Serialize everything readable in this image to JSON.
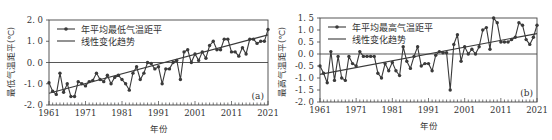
{
  "chart_data": [
    {
      "type": "line",
      "panel_label": "(a)",
      "title": "",
      "xlabel": "年份",
      "ylabel": "最低气温距平(℃)",
      "ylim": [
        -2.0,
        2.0
      ],
      "xlim": [
        1961,
        2021
      ],
      "yticks": [
        "2.0",
        "1.0",
        "0.0",
        "-1.0",
        "-2.0"
      ],
      "xticks": [
        "1961",
        "1971",
        "1981",
        "1991",
        "2001",
        "2011",
        "2021"
      ],
      "grid": false,
      "legend_position": "upper-left",
      "series": [
        {
          "name": "年平均最低气温距平",
          "marker": "circle",
          "x": [
            1961,
            1962,
            1963,
            1964,
            1965,
            1966,
            1967,
            1968,
            1969,
            1970,
            1971,
            1972,
            1973,
            1974,
            1975,
            1976,
            1977,
            1978,
            1979,
            1980,
            1981,
            1982,
            1983,
            1984,
            1985,
            1986,
            1987,
            1988,
            1989,
            1990,
            1991,
            1992,
            1993,
            1994,
            1995,
            1996,
            1997,
            1998,
            1999,
            2000,
            2001,
            2002,
            2003,
            2004,
            2005,
            2006,
            2007,
            2008,
            2009,
            2010,
            2011,
            2012,
            2013,
            2014,
            2015,
            2016,
            2017,
            2018,
            2019,
            2020,
            2021
          ],
          "values": [
            -0.95,
            -1.35,
            -1.5,
            -0.5,
            -1.4,
            -1.0,
            -1.6,
            -1.6,
            -0.9,
            -1.0,
            -1.1,
            -0.9,
            -0.85,
            -0.5,
            -0.8,
            -0.9,
            -0.6,
            -1.0,
            -0.7,
            -0.6,
            -0.8,
            -1.0,
            -1.3,
            -0.5,
            -0.2,
            -0.8,
            -0.5,
            0.0,
            -0.05,
            -0.3,
            -0.2,
            -1.0,
            -0.3,
            -0.3,
            0.0,
            0.1,
            -0.8,
            0.5,
            0.6,
            0.0,
            0.4,
            0.1,
            0.5,
            0.2,
            0.8,
            1.0,
            0.6,
            0.6,
            1.1,
            1.1,
            0.5,
            0.5,
            0.3,
            0.7,
            0.4,
            1.1,
            1.1,
            0.9,
            1.0,
            1.0,
            1.55
          ]
        },
        {
          "name": "线性变化趋势",
          "marker": "none",
          "x": [
            1961,
            2021
          ],
          "values": [
            -1.45,
            1.3
          ]
        }
      ]
    },
    {
      "type": "line",
      "panel_label": "(b)",
      "title": "",
      "xlabel": "年份",
      "ylabel": "最高气温距平(℃)",
      "ylim": [
        -2.0,
        1.5
      ],
      "xlim": [
        1961,
        2021
      ],
      "yticks": [
        "1.5",
        "1.0",
        "0.5",
        "0.0",
        "-0.5",
        "-1.0",
        "-1.5",
        "-2.0"
      ],
      "xticks": [
        "1961",
        "1971",
        "1981",
        "1991",
        "2001",
        "2011",
        "2021"
      ],
      "grid": false,
      "legend_position": "upper-left",
      "series": [
        {
          "name": "年平均最高气温距平",
          "marker": "circle",
          "x": [
            1961,
            1962,
            1963,
            1964,
            1965,
            1966,
            1967,
            1968,
            1969,
            1970,
            1971,
            1972,
            1973,
            1974,
            1975,
            1976,
            1977,
            1978,
            1979,
            1980,
            1981,
            1982,
            1983,
            1984,
            1985,
            1986,
            1987,
            1988,
            1989,
            1990,
            1991,
            1992,
            1993,
            1994,
            1995,
            1996,
            1997,
            1998,
            1999,
            2000,
            2001,
            2002,
            2003,
            2004,
            2005,
            2006,
            2007,
            2008,
            2009,
            2010,
            2011,
            2012,
            2013,
            2014,
            2015,
            2016,
            2017,
            2018,
            2019,
            2020,
            2021
          ],
          "values": [
            -0.5,
            -0.8,
            -1.2,
            0.1,
            -1.1,
            -0.1,
            -1.0,
            -1.1,
            -0.1,
            -0.4,
            -0.5,
            0.1,
            -0.1,
            -0.1,
            -0.1,
            -0.1,
            -0.8,
            -1.0,
            -0.4,
            -0.7,
            -0.35,
            -0.7,
            -0.9,
            0.3,
            -0.3,
            -0.6,
            -0.1,
            0.3,
            -0.5,
            -0.4,
            -0.4,
            -0.7,
            -0.05,
            0.1,
            0.05,
            0.05,
            -1.5,
            0.4,
            0.8,
            -0.3,
            0.3,
            0.0,
            0.2,
            0.0,
            0.3,
            1.0,
            1.1,
            0.2,
            1.5,
            1.3,
            0.5,
            0.5,
            0.5,
            0.6,
            0.7,
            1.3,
            1.2,
            0.6,
            0.4,
            0.7,
            1.2
          ]
        },
        {
          "name": "线性变化趋势",
          "marker": "none",
          "x": [
            1961,
            2021
          ],
          "values": [
            -0.85,
            0.85
          ]
        }
      ]
    }
  ],
  "colors": {
    "series": "#3a3a3a",
    "axis": "#444444",
    "background": "#ffffff"
  }
}
